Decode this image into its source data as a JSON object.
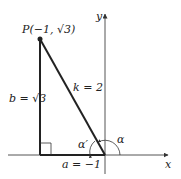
{
  "diagram": {
    "point_label": "P(−1, √3)",
    "hypotenuse_label": "k = 2",
    "vertical_leg_label": "b = √3",
    "horizontal_leg_label": "a = −1",
    "x_axis_label": "x",
    "y_axis_label": "y",
    "angle_label": "α",
    "reference_angle_label": "α′"
  }
}
